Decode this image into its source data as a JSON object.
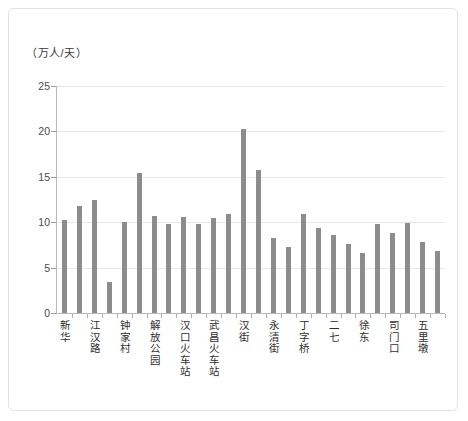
{
  "chart_data": {
    "type": "bar",
    "title": "",
    "subtitle": "",
    "xlabel": "",
    "ylabel": "（万人/天）",
    "ylim": [
      0,
      25
    ],
    "yticks": [
      0,
      5,
      10,
      15,
      20,
      25
    ],
    "grid": true,
    "legend": null,
    "categories": [
      "新华",
      "",
      "江汉路",
      "",
      "钟家村",
      "",
      "解放公园",
      "",
      "汉口火车站",
      "",
      "武昌火车站",
      "",
      "汉街",
      "",
      "永清街",
      "",
      "丁字桥",
      "",
      "二七",
      "",
      "徐东",
      "",
      "司门口",
      "",
      "五里墩",
      ""
    ],
    "tick_labels": [
      "新华",
      "江汉路",
      "钟家村",
      "解放公园",
      "汉口火车站",
      "武昌火车站",
      "汉街",
      "永清街",
      "丁字桥",
      "二七",
      "徐东",
      "司门口",
      "五里墩"
    ],
    "values": [
      10.2,
      11.8,
      12.5,
      3.4,
      10.0,
      15.4,
      10.7,
      9.8,
      10.6,
      9.8,
      10.5,
      10.9,
      20.3,
      15.7,
      8.3,
      7.3,
      10.9,
      9.4,
      8.6,
      7.6,
      6.6,
      9.8,
      8.8,
      9.9,
      7.8,
      6.8
    ],
    "bar_color": "#8c8c8c",
    "grid_color": "#e6e6e6",
    "axis_color": "#b9b9b9"
  },
  "figure": {
    "border_color": "#e2e2e2",
    "background": "#ffffff"
  }
}
